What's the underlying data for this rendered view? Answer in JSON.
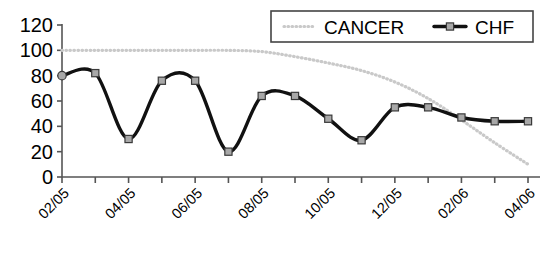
{
  "chart_data": {
    "type": "line",
    "title": "",
    "xlabel": "",
    "ylabel": "",
    "ylim": [
      0,
      120
    ],
    "ytick_step": 20,
    "yticks": [
      "0",
      "20",
      "40",
      "60",
      "80",
      "100",
      "120"
    ],
    "grid": false,
    "legend_position": "top-right",
    "x": [
      "02/05",
      "03/05",
      "04/05",
      "05/05",
      "06/05",
      "07/05",
      "08/05",
      "09/05",
      "10/05",
      "11/05",
      "12/05",
      "01/06",
      "02/06",
      "03/06",
      "04/06"
    ],
    "xtick_labels": [
      "02/05",
      "04/05",
      "06/05",
      "08/05",
      "10/05",
      "12/05",
      "02/06",
      "04/06"
    ],
    "xtick_label_every": 2,
    "series": [
      {
        "name": "CANCER",
        "color": "#c9c9c9",
        "style": "dotted",
        "marker": "none",
        "smoothed": true,
        "values": [
          100,
          100,
          100,
          100,
          100,
          100,
          99,
          95,
          90,
          84,
          75,
          62,
          45,
          27,
          10
        ]
      },
      {
        "name": "CHF",
        "color": "#111111",
        "style": "solid",
        "marker": "square",
        "smoothed": true,
        "values": [
          80,
          82,
          30,
          76,
          76,
          20,
          64,
          64,
          46,
          29,
          55,
          55,
          47,
          44,
          44
        ]
      }
    ]
  },
  "legend": {
    "items": [
      {
        "label": "CANCER",
        "swatch": "dotted-gray-line"
      },
      {
        "label": "CHF",
        "swatch": "solid-black-line-square-marker"
      }
    ]
  },
  "colors": {
    "cancer": "#c9c9c9",
    "chf": "#111111",
    "marker_fill": "#a8a8a8",
    "axis": "#555555",
    "legend_border": "#444444",
    "background": "#ffffff"
  }
}
